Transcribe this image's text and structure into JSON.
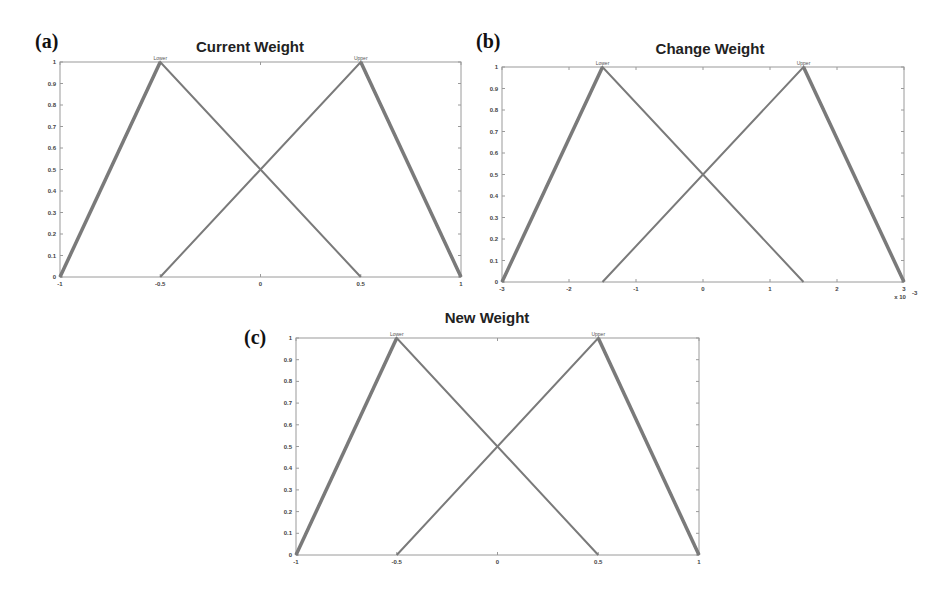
{
  "figure": {
    "panels": [
      {
        "label": "(a)",
        "title": "Current Weight"
      },
      {
        "label": "(b)",
        "title": "Change Weight"
      },
      {
        "label": "(c)",
        "title": "New Weight"
      }
    ],
    "colors": {
      "line": "#7a7a7a",
      "axis": "#9a9a9a",
      "background": "#ffffff"
    }
  },
  "chart_data": [
    {
      "type": "line",
      "title": "Current Weight",
      "panel": "(a)",
      "xlabel": "",
      "ylabel": "",
      "xlim": [
        -1,
        1
      ],
      "ylim": [
        0,
        1
      ],
      "xticks": [
        "-1",
        "-0.5",
        "0",
        "0.5",
        "1"
      ],
      "yticks": [
        "0",
        "0.1",
        "0.2",
        "0.3",
        "0.4",
        "0.5",
        "0.6",
        "0.7",
        "0.8",
        "0.9",
        "1"
      ],
      "grid": false,
      "series": [
        {
          "name": "Lower",
          "x": [
            -1,
            -0.5,
            0.5
          ],
          "y": [
            0,
            1,
            0
          ]
        },
        {
          "name": "Upper",
          "x": [
            -0.5,
            0.5,
            1
          ],
          "y": [
            0,
            1,
            0
          ]
        }
      ]
    },
    {
      "type": "line",
      "title": "Change Weight",
      "panel": "(b)",
      "xlabel": "",
      "ylabel": "",
      "x_multiplier": "x 10^-3",
      "xlim": [
        -3,
        3
      ],
      "ylim": [
        0,
        1
      ],
      "xticks": [
        "-3",
        "-2",
        "-1",
        "0",
        "1",
        "2",
        "3"
      ],
      "yticks": [
        "0",
        "0.1",
        "0.2",
        "0.3",
        "0.4",
        "0.5",
        "0.6",
        "0.7",
        "0.8",
        "0.9",
        "1"
      ],
      "grid": false,
      "series": [
        {
          "name": "Lower",
          "x": [
            -3,
            -1.5,
            1.5
          ],
          "y": [
            0,
            1,
            0
          ]
        },
        {
          "name": "Upper",
          "x": [
            -1.5,
            1.5,
            3
          ],
          "y": [
            0,
            1,
            0
          ]
        }
      ]
    },
    {
      "type": "line",
      "title": "New Weight",
      "panel": "(c)",
      "xlabel": "",
      "ylabel": "",
      "xlim": [
        -1,
        1
      ],
      "ylim": [
        0,
        1
      ],
      "xticks": [
        "-1",
        "-0.5",
        "0",
        "0.5",
        "1"
      ],
      "yticks": [
        "0",
        "0.1",
        "0.2",
        "0.3",
        "0.4",
        "0.5",
        "0.6",
        "0.7",
        "0.8",
        "0.9",
        "1"
      ],
      "grid": false,
      "series": [
        {
          "name": "Lower",
          "x": [
            -1,
            -0.5,
            0.5
          ],
          "y": [
            0,
            1,
            0
          ]
        },
        {
          "name": "Upper",
          "x": [
            -0.5,
            0.5,
            1
          ],
          "y": [
            0,
            1,
            0
          ]
        }
      ]
    }
  ]
}
